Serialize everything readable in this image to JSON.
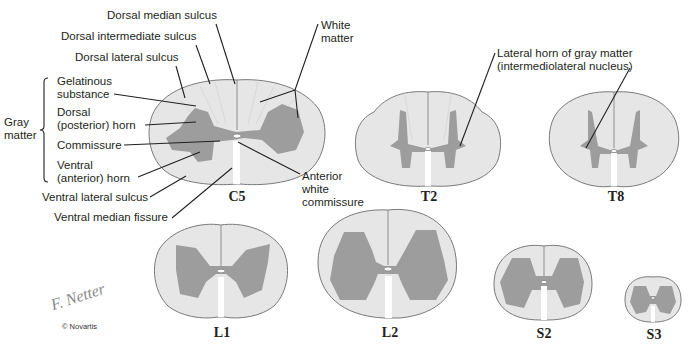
{
  "figure": {
    "segments": [
      {
        "id": "C5",
        "label": "C5"
      },
      {
        "id": "T2",
        "label": "T2"
      },
      {
        "id": "T8",
        "label": "T8"
      },
      {
        "id": "L1",
        "label": "L1"
      },
      {
        "id": "L2",
        "label": "L2"
      },
      {
        "id": "S2",
        "label": "S2"
      },
      {
        "id": "S3",
        "label": "S3"
      }
    ],
    "labels": {
      "dorsal_median_sulcus": "Dorsal median sulcus",
      "dorsal_intermediate_sulcus": "Dorsal intermediate sulcus",
      "dorsal_lateral_sulcus": "Dorsal lateral sulcus",
      "gelatinous_1": "Gelatinous",
      "gelatinous_2": "substance",
      "dorsal_horn_1": "Dorsal",
      "dorsal_horn_2": "(posterior) horn",
      "commissure": "Commissure",
      "ventral_horn_1": "Ventral",
      "ventral_horn_2": "(anterior) horn",
      "gray_matter_1": "Gray",
      "gray_matter_2": "matter",
      "ventral_lateral_sulcus": "Ventral lateral sulcus",
      "ventral_median_fissure": "Ventral median fissure",
      "white_matter_1": "White",
      "white_matter_2": "matter",
      "anterior_white_commissure_1": "Anterior",
      "anterior_white_commissure_2": "white",
      "anterior_white_commissure_3": "commissure",
      "lateral_horn_1": "Lateral horn of gray matter",
      "lateral_horn_2": "(intermediolateral nucleus)"
    },
    "signature": "F. Netter",
    "copyright": "© Novartis",
    "colors": {
      "white_matter": "#e6e6e6",
      "gray_matter": "#9d9d9d",
      "outline": "#7a7a7a",
      "leader_line": "#231f20"
    }
  }
}
